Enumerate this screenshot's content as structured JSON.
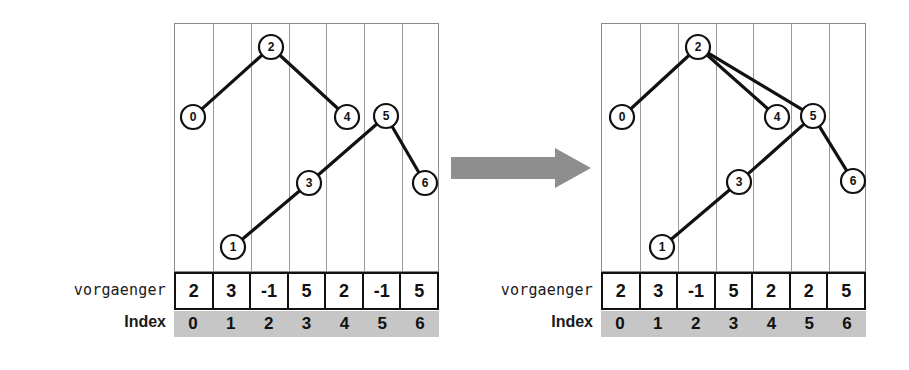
{
  "figure": {
    "transition_icon": "right-arrow-icon"
  },
  "colors": {
    "node_stroke": "#111111",
    "edge": "#111111",
    "grid_line": "#9a9a9a",
    "index_band": "#c6c6c6",
    "arrow": "#8e8e8e",
    "table_border": "#111111"
  },
  "panels": [
    {
      "id": "before",
      "labels": {
        "array": "vorgaenger",
        "index": "Index"
      },
      "array": {
        "name": "vorgaenger",
        "values": [
          "2",
          "3",
          "-1",
          "5",
          "2",
          "-1",
          "5"
        ]
      },
      "index": {
        "name": "Index",
        "values": [
          "0",
          "1",
          "2",
          "3",
          "4",
          "5",
          "6"
        ]
      },
      "nodes": [
        {
          "label": "0",
          "col": 0,
          "cx": 19,
          "cy": 94
        },
        {
          "label": "1",
          "col": 1,
          "cx": 59,
          "cy": 224
        },
        {
          "label": "2",
          "col": 2,
          "cx": 97,
          "cy": 24
        },
        {
          "label": "3",
          "col": 3,
          "cx": 135,
          "cy": 160
        },
        {
          "label": "4",
          "col": 4,
          "cx": 173,
          "cy": 94
        },
        {
          "label": "5",
          "col": 5,
          "cx": 212,
          "cy": 93
        },
        {
          "label": "6",
          "col": 6,
          "cx": 251,
          "cy": 160
        }
      ],
      "edges": [
        {
          "from": "0",
          "to": "2"
        },
        {
          "from": "2",
          "to": "4"
        },
        {
          "from": "1",
          "to": "3"
        },
        {
          "from": "3",
          "to": "5"
        },
        {
          "from": "5",
          "to": "6"
        }
      ]
    },
    {
      "id": "after",
      "labels": {
        "array": "vorgaenger",
        "index": "Index"
      },
      "array": {
        "name": "vorgaenger",
        "values": [
          "2",
          "3",
          "-1",
          "5",
          "2",
          "2",
          "5"
        ]
      },
      "index": {
        "name": "Index",
        "values": [
          "0",
          "1",
          "2",
          "3",
          "4",
          "5",
          "6"
        ]
      },
      "nodes": [
        {
          "label": "0",
          "col": 0,
          "cx": 21,
          "cy": 94
        },
        {
          "label": "1",
          "col": 1,
          "cx": 61,
          "cy": 224
        },
        {
          "label": "2",
          "col": 2,
          "cx": 97,
          "cy": 24
        },
        {
          "label": "3",
          "col": 3,
          "cx": 138,
          "cy": 159
        },
        {
          "label": "4",
          "col": 4,
          "cx": 176,
          "cy": 94
        },
        {
          "label": "5",
          "col": 5,
          "cx": 212,
          "cy": 93
        },
        {
          "label": "6",
          "col": 6,
          "cx": 252,
          "cy": 158
        }
      ],
      "edges": [
        {
          "from": "0",
          "to": "2"
        },
        {
          "from": "2",
          "to": "4"
        },
        {
          "from": "2",
          "to": "5"
        },
        {
          "from": "1",
          "to": "3"
        },
        {
          "from": "3",
          "to": "5"
        },
        {
          "from": "5",
          "to": "6"
        }
      ]
    }
  ],
  "bleed_text": [
    {
      "text": "",
      "x": 0,
      "y": 0
    }
  ]
}
